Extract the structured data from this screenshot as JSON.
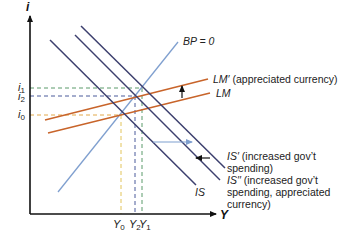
{
  "axes": {
    "y_label": "i",
    "x_label": "Y"
  },
  "interest_levels": [
    {
      "name": "i1",
      "base": "i",
      "sub": "1",
      "color": "#5a9a6a"
    },
    {
      "name": "i2",
      "base": "i",
      "sub": "2",
      "color": "#4a5a9a"
    },
    {
      "name": "i0",
      "base": "i",
      "sub": "0",
      "color": "#e2a94a"
    }
  ],
  "output_levels": [
    {
      "name": "Y0",
      "base": "Y",
      "sub": "0",
      "color": "#e2c45a"
    },
    {
      "name": "Y2",
      "base": "Y",
      "sub": "2",
      "color": "#4a5a9a"
    },
    {
      "name": "Y1",
      "base": "Y",
      "sub": "1",
      "color": "#5a9a6a"
    }
  ],
  "curves": {
    "bp": {
      "label": "BP = 0",
      "color": "#7f9fcf"
    },
    "lm": {
      "label": "LM",
      "color": "#c8642a"
    },
    "lm_prime": {
      "label": "LM′",
      "note": "(appreciated currency)",
      "color": "#c8642a"
    },
    "is": {
      "label": "IS",
      "color": "#3c3f6e"
    },
    "is_prime": {
      "label": "IS′",
      "note_line1": "(increased gov’t",
      "note_line2": "spending)",
      "color": "#3c3f6e"
    },
    "is_double_prime": {
      "label": "IS′′",
      "note_line1": "(increased gov’t",
      "note_line2": "spending, appreciated",
      "note_line3": "currency)",
      "color": "#3c3f6e"
    }
  },
  "shift_arrows": {
    "lm_shift_color": "#111111",
    "is_right_shift_color": "#7f9fcf",
    "is_left_shift_color": "#111111"
  }
}
